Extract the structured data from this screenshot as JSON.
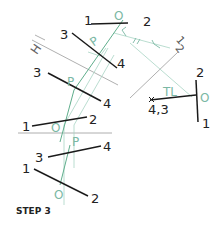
{
  "step_label": "STEP 3",
  "colors": {
    "line": "#1a1a1a",
    "construction": "#9a9a9a",
    "accent": "#5fae8c",
    "accent_light": "#a8d4c4"
  },
  "labels": {
    "top_view": {
      "p1": "1",
      "p2": "2",
      "p3": "3",
      "p4": "4",
      "o": "O",
      "p": "P"
    },
    "front_view": {
      "p1": "1",
      "p2": "2",
      "p3": "3",
      "p4": "4",
      "o": "O",
      "p": "P"
    },
    "aux_view": {
      "p1": "1",
      "p2": "2",
      "p3": "3",
      "p4": "4",
      "o": "O",
      "p": "P"
    },
    "point_view": {
      "p1": "1",
      "p2": "2",
      "p43": "4,3",
      "o": "O",
      "tl": "TL"
    },
    "fold_h1": "H",
    "fold_h1_sub": "1",
    "fold_12_a": "1",
    "fold_12_b": "2"
  }
}
